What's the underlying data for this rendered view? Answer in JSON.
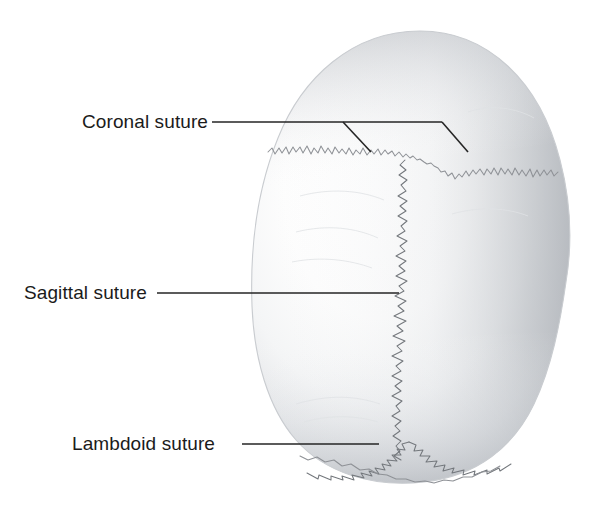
{
  "figure": {
    "background_color": "#ffffff",
    "label_color": "#1b1b1b",
    "leader_color": "#252525",
    "suture_color": "#8e9196",
    "bone_color_light": "#fbfbfb",
    "bone_color_shadow": "#b4b8bd"
  },
  "labels": [
    {
      "id": "coronal",
      "text": "Coronal suture",
      "x": 82,
      "y": 128,
      "leader_points": "212,122 442,122",
      "branch_left": "343,122 371,152",
      "branch_right": "442,122 468,152"
    },
    {
      "id": "sagittal",
      "text": "Sagittal suture",
      "x": 24,
      "y": 299,
      "leader_points": "157,293 399,293",
      "branch_left": "",
      "branch_right": ""
    },
    {
      "id": "lambdoid",
      "text": "Lambdoid suture",
      "x": 72,
      "y": 450,
      "leader_points": "242,444 379,444",
      "branch_left": "",
      "branch_right": ""
    }
  ],
  "structures": [
    {
      "id": "skull",
      "name": "cranium-superior-view"
    },
    {
      "id": "coronal-suture",
      "name": "coronal-suture-line"
    },
    {
      "id": "sagittal-suture",
      "name": "sagittal-suture-line"
    },
    {
      "id": "lambdoid-suture",
      "name": "lambdoid-suture-line"
    }
  ]
}
